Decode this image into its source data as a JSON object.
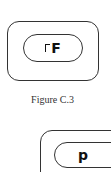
{
  "figure1": {
    "glyph_prefix_icon": "corner-bracket",
    "glyph": "F",
    "caption": "Figure C.3"
  },
  "figure2": {
    "glyph": "p"
  }
}
